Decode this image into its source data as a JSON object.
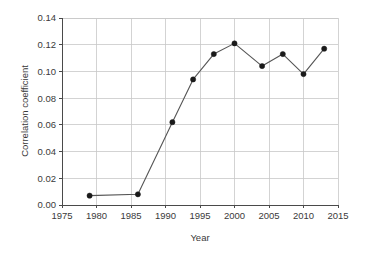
{
  "chart_data": {
    "type": "line",
    "title": "",
    "xlabel": "Year",
    "ylabel": "Correlation coefficient",
    "xlim": [
      1975,
      2015
    ],
    "ylim": [
      0.0,
      0.14
    ],
    "grid": true,
    "legend": "none",
    "x_ticks": [
      1975,
      1980,
      1985,
      1990,
      1995,
      2000,
      2005,
      2010,
      2015
    ],
    "x_tick_labels": [
      "1975",
      "1980",
      "1985",
      "1990",
      "1995",
      "2000",
      "2005",
      "2010",
      "2015"
    ],
    "y_ticks": [
      0.0,
      0.02,
      0.04,
      0.06,
      0.08,
      0.1,
      0.12,
      0.14
    ],
    "y_tick_labels": [
      "0.00",
      "0.02",
      "0.04",
      "0.06",
      "0.08",
      "0.10",
      "0.12",
      "0.14"
    ],
    "x": [
      1979,
      1986,
      1991,
      1994,
      1997,
      2000,
      2004,
      2007,
      2010,
      2013
    ],
    "values": [
      0.007,
      0.008,
      0.062,
      0.094,
      0.113,
      0.121,
      0.104,
      0.113,
      0.098,
      0.117
    ],
    "marker": "circle",
    "marker_color": "#1a1a1a",
    "line_color": "#555555",
    "grid_color": "#c8c8c8",
    "background_color": "#ffffff"
  }
}
